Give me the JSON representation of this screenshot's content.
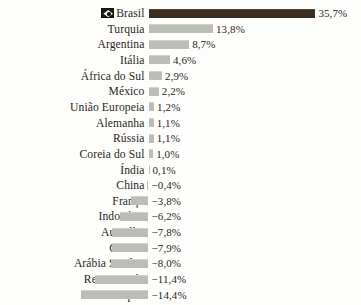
{
  "chart_data": {
    "type": "bar",
    "orientation": "horizontal",
    "title": "",
    "subtitle": "",
    "xlabel": "",
    "ylabel": "",
    "grid": false,
    "legend": null,
    "axis_baseline": 0,
    "value_suffix": "%",
    "decimal_separator": ",",
    "xlim": [
      -15.0,
      35.7
    ],
    "categories": [
      "Brasil",
      "Turquia",
      "Argentina",
      "Itália",
      "África do Sul",
      "México",
      "União Europeia",
      "Alemanha",
      "Rússia",
      "Coreia do Sul",
      "Índia",
      "China",
      "França",
      "Indonésia",
      "Austrália",
      "Canadá",
      "Arábia Saudita",
      "Reino Unido",
      "Japão",
      "Estados Unidos"
    ],
    "values": [
      35.7,
      13.8,
      8.7,
      4.6,
      2.9,
      2.2,
      1.2,
      1.1,
      1.1,
      1.0,
      0.1,
      -0.4,
      -3.8,
      -6.2,
      -7.8,
      -7.9,
      -8.0,
      -11.4,
      -14.4,
      -15.0
    ],
    "value_labels": [
      "35,7%",
      "13,8%",
      "8,7%",
      "4,6%",
      "2,9%",
      "2,2%",
      "1,2%",
      "1,1%",
      "1,1%",
      "1,0%",
      "0,1%",
      "−0,4%",
      "−3,8%",
      "−6,2%",
      "−7,8%",
      "−7,9%",
      "−8,0%",
      "−11,4%",
      "−14,4%",
      "−15,0%"
    ],
    "highlight_index": 0,
    "highlight_color": "#3a2d22",
    "bar_color": "#bdbdb7",
    "text_color": "#2b2722",
    "background_color": "#fdfdfb",
    "icons": {
      "0": "brazil-flag-icon"
    }
  }
}
